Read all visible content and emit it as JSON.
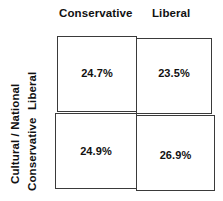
{
  "chart_data": {
    "type": "heatmap",
    "title": "",
    "subtitle": "",
    "xlabel": "",
    "ylabel": "Cultural / National",
    "grid": false,
    "legend": "none",
    "x_categories": [
      "Conservative",
      "Liberal"
    ],
    "y_categories": [
      "Liberal",
      "Conservative"
    ],
    "cells": [
      {
        "row": "Liberal",
        "col": "Conservative",
        "value": 24.7,
        "label": "24.7%"
      },
      {
        "row": "Liberal",
        "col": "Liberal",
        "value": 23.5,
        "label": "23.5%"
      },
      {
        "row": "Conservative",
        "col": "Conservative",
        "value": 24.9,
        "label": "24.9%"
      },
      {
        "row": "Conservative",
        "col": "Liberal",
        "value": 26.9,
        "label": "26.9%"
      }
    ],
    "values": [
      [
        24.7,
        23.5
      ],
      [
        24.9,
        26.9
      ]
    ]
  },
  "columns": {
    "header_conservative": "Conservative",
    "header_liberal": "Liberal"
  },
  "rows": {
    "axis_title": "Cultural / National",
    "label_liberal": "Liberal",
    "label_conservative": "Conservative"
  },
  "values": {
    "top_left": "24.7%",
    "top_right": "23.5%",
    "bottom_left": "24.9%",
    "bottom_right": "26.9%"
  },
  "colors": {
    "background": "#ffffff",
    "cell_fill": "#ffffff",
    "cell_border": "#3a3a3a",
    "text": "#111111"
  }
}
